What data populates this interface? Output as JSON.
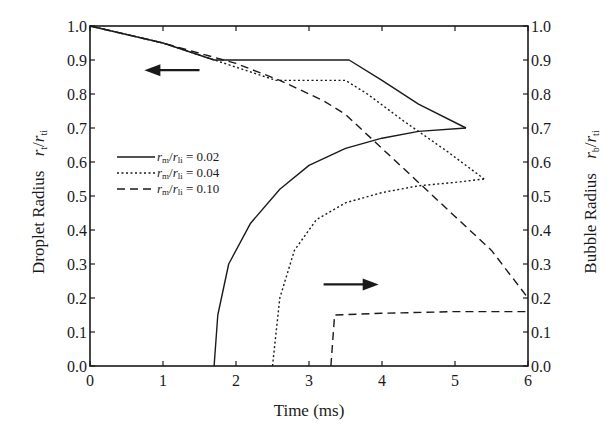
{
  "chart_data": {
    "type": "line",
    "title": "",
    "xlabel": "Time (ms)",
    "ylabel_left": "Droplet Radius  r_t/r_ti",
    "ylabel_right": "Bubble Radius  r_b/r_ti",
    "xlim": [
      0,
      6
    ],
    "ylim_left": [
      0.0,
      1.0
    ],
    "ylim_right": [
      0.0,
      1.0
    ],
    "x_ticks": [
      "0",
      "1",
      "2",
      "3",
      "4",
      "5",
      "6"
    ],
    "y_ticks_left": [
      "0.0",
      "0.1",
      "0.2",
      "0.3",
      "0.4",
      "0.5",
      "0.6",
      "0.7",
      "0.8",
      "0.9",
      "1.0"
    ],
    "y_ticks_right": [
      "0.0",
      "0.1",
      "0.2",
      "0.3",
      "0.4",
      "0.5",
      "0.6",
      "0.7",
      "0.8",
      "0.9",
      "1.0"
    ],
    "grid": false,
    "legend_position": "left-middle inside",
    "annotations": [
      {
        "type": "arrow",
        "direction": "left",
        "meaning": "droplet curves use left axis",
        "x_range": [
          0.8,
          1.5
        ],
        "y": 0.87
      },
      {
        "type": "arrow",
        "direction": "right",
        "meaning": "bubble curves use right axis",
        "x_range": [
          3.2,
          3.9
        ],
        "y": 0.24
      }
    ],
    "series": [
      {
        "name": "r_m/r_li = 0.02",
        "style": "solid",
        "droplet": {
          "x": [
            0,
            1.0,
            1.7,
            3.55,
            4.0,
            4.5,
            5.15
          ],
          "y": [
            1.0,
            0.95,
            0.9,
            0.9,
            0.84,
            0.77,
            0.7
          ]
        },
        "bubble": {
          "x": [
            1.7,
            1.75,
            1.9,
            2.2,
            2.6,
            3.0,
            3.5,
            4.0,
            4.5,
            5.15
          ],
          "y": [
            0.0,
            0.15,
            0.3,
            0.42,
            0.52,
            0.59,
            0.64,
            0.67,
            0.69,
            0.7
          ]
        }
      },
      {
        "name": "r_m/r_li = 0.04",
        "style": "dotted",
        "droplet": {
          "x": [
            0,
            1.0,
            2.55,
            3.5,
            3.8,
            4.3,
            4.9,
            5.4
          ],
          "y": [
            1.0,
            0.95,
            0.84,
            0.84,
            0.8,
            0.72,
            0.63,
            0.55
          ]
        },
        "bubble": {
          "x": [
            2.5,
            2.6,
            2.8,
            3.1,
            3.5,
            4.0,
            4.5,
            5.0,
            5.4
          ],
          "y": [
            0.0,
            0.2,
            0.34,
            0.43,
            0.48,
            0.51,
            0.53,
            0.54,
            0.55
          ]
        }
      },
      {
        "name": "r_m/r_li = 0.10",
        "style": "dashed",
        "droplet": {
          "x": [
            0,
            1.0,
            2.0,
            2.6,
            3.2,
            3.5,
            4.0,
            4.5,
            5.0,
            5.5,
            6.0
          ],
          "y": [
            1.0,
            0.95,
            0.89,
            0.84,
            0.78,
            0.74,
            0.64,
            0.54,
            0.44,
            0.34,
            0.2
          ]
        },
        "bubble": {
          "x": [
            3.3,
            3.35,
            4.0,
            5.0,
            6.0
          ],
          "y": [
            0.0,
            0.15,
            0.155,
            0.16,
            0.16
          ]
        }
      }
    ]
  },
  "labels": {
    "x_axis_title": "Time (ms)",
    "y_left_title": "Droplet Radius",
    "y_left_symbol": "r",
    "y_left_sub": "t",
    "y_left_den": "r",
    "y_left_den_sub": "ti",
    "y_right_title": "Bubble Radius",
    "y_right_symbol": "r",
    "y_right_sub": "b",
    "y_right_den": "r",
    "y_right_den_sub": "ti",
    "legend": [
      {
        "prefix": "r",
        "prefix_sub": "m",
        "den": "r",
        "den_sub": "li",
        "value": " = 0.02"
      },
      {
        "prefix": "r",
        "prefix_sub": "m",
        "den": "r",
        "den_sub": "li",
        "value": " = 0.04"
      },
      {
        "prefix": "r",
        "prefix_sub": "m",
        "den": "r",
        "den_sub": "li",
        "value": " = 0.10"
      }
    ]
  },
  "colors": {
    "ink": "#1a1a1a",
    "background": "#ffffff"
  }
}
